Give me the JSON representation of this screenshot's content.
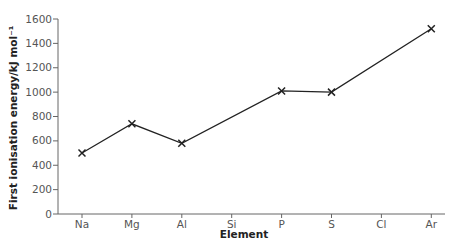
{
  "chart_data": {
    "type": "line",
    "title": "",
    "xlabel": "Element",
    "ylabel": "First ionisation energy/kJ mol⁻¹",
    "categories": [
      "Na",
      "Mg",
      "Al",
      "Si",
      "P",
      "S",
      "Cl",
      "Ar"
    ],
    "series": [
      {
        "name": "First ionisation energy",
        "marker": "x",
        "points": [
          {
            "x": "Na",
            "y": 500
          },
          {
            "x": "Mg",
            "y": 740
          },
          {
            "x": "Al",
            "y": 580
          },
          {
            "x": "P",
            "y": 1010
          },
          {
            "x": "S",
            "y": 1000
          },
          {
            "x": "Ar",
            "y": 1520
          }
        ]
      }
    ],
    "ylim": [
      0,
      1600
    ],
    "yticks": [
      0,
      200,
      400,
      600,
      800,
      1000,
      1200,
      1400,
      1600
    ],
    "grid": false,
    "legend": null,
    "line_color": "#222222"
  }
}
